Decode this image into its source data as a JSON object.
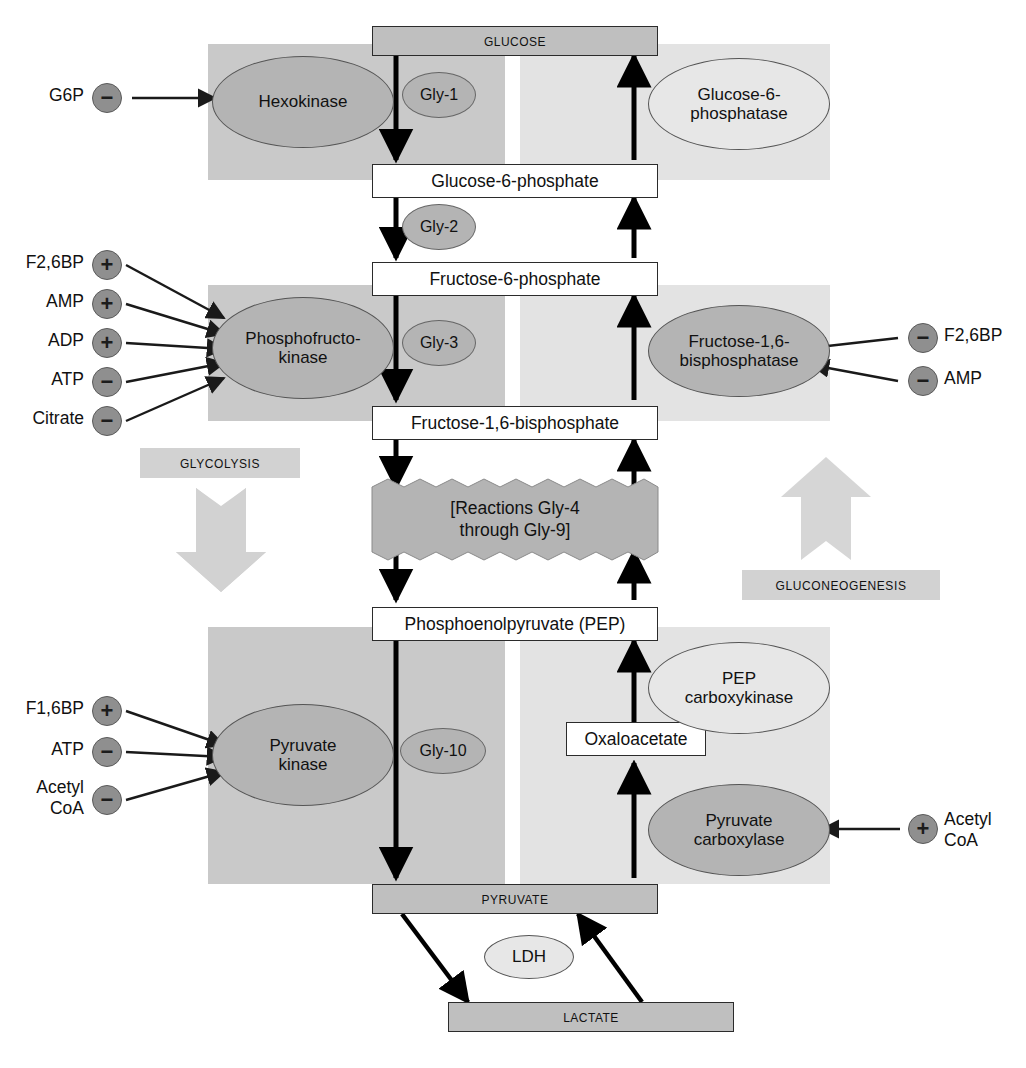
{
  "diagram": {
    "pathway_labels": {
      "glycolysis": "GLYCOLYSIS",
      "gluconeogenesis": "GLUCONEOGENESIS"
    },
    "colors": {
      "glycolysis_band": "#c9c9c9",
      "gluconeogenesis_band": "#e3e3e3",
      "enzyme_dark": "#b4b4b4",
      "enzyme_light": "#e7e7e7",
      "terminal_box": "#bfbfbf",
      "regulator_circle": "#8f8f8f",
      "pathway_label_bg": "#d2d2d2",
      "arrow": "#000000"
    }
  },
  "metabolites": [
    {
      "id": "glucose",
      "label": "GLUCOSE",
      "style": "terminal"
    },
    {
      "id": "g6p",
      "label": "Glucose-6-phosphate",
      "style": "box"
    },
    {
      "id": "f6p",
      "label": "Fructose-6-phosphate",
      "style": "box"
    },
    {
      "id": "f16bp",
      "label": "Fructose-1,6-bisphosphate",
      "style": "box"
    },
    {
      "id": "pep",
      "label": "Phosphoenolpyruvate (PEP)",
      "style": "box"
    },
    {
      "id": "oaa",
      "label": "Oxaloacetate",
      "style": "box"
    },
    {
      "id": "pyruvate",
      "label": "PYRUVATE",
      "style": "terminal"
    },
    {
      "id": "lactate",
      "label": "LACTATE",
      "style": "terminal"
    }
  ],
  "reaction_block": {
    "line1": "[Reactions Gly-4",
    "line2": "through Gly-9]"
  },
  "steps": [
    {
      "id": "gly1",
      "label": "Gly-1"
    },
    {
      "id": "gly2",
      "label": "Gly-2"
    },
    {
      "id": "gly3",
      "label": "Gly-3"
    },
    {
      "id": "gly10",
      "label": "Gly-10"
    }
  ],
  "enzymes": {
    "glycolytic": [
      {
        "id": "hexokinase",
        "line1": "Hexokinase",
        "line2": "",
        "fill": "dark"
      },
      {
        "id": "pfk",
        "line1": "Phosphofructo-",
        "line2": "kinase",
        "fill": "dark"
      },
      {
        "id": "pyruvate-kinase",
        "line1": "Pyruvate",
        "line2": "kinase",
        "fill": "dark"
      }
    ],
    "gluconeogenic": [
      {
        "id": "g6pase",
        "line1": "Glucose-6-",
        "line2": "phosphatase",
        "fill": "light"
      },
      {
        "id": "fbpase",
        "line1": "Fructose-1,6-",
        "line2": "bisphosphatase",
        "fill": "dark"
      },
      {
        "id": "pepck",
        "line1": "PEP",
        "line2": "carboxykinase",
        "fill": "light"
      },
      {
        "id": "pyruvate-carboxylase",
        "line1": "Pyruvate",
        "line2": "carboxylase",
        "fill": "dark"
      }
    ],
    "shared": [
      {
        "id": "ldh",
        "line1": "LDH",
        "line2": "",
        "fill": "light"
      }
    ]
  },
  "regulators": {
    "hexokinase": [
      {
        "label": "G6P",
        "sign": "−",
        "effect": "inhibits"
      }
    ],
    "phosphofructokinase": [
      {
        "label": "F2,6BP",
        "sign": "+",
        "effect": "activates"
      },
      {
        "label": "AMP",
        "sign": "+",
        "effect": "activates"
      },
      {
        "label": "ADP",
        "sign": "+",
        "effect": "activates"
      },
      {
        "label": "ATP",
        "sign": "−",
        "effect": "inhibits"
      },
      {
        "label": "Citrate",
        "sign": "−",
        "effect": "inhibits"
      }
    ],
    "fructose_1_6_bisphosphatase": [
      {
        "label": "F2,6BP",
        "sign": "−",
        "effect": "inhibits"
      },
      {
        "label": "AMP",
        "sign": "−",
        "effect": "inhibits"
      }
    ],
    "pyruvate_kinase": [
      {
        "label": "F1,6BP",
        "sign": "+",
        "effect": "activates"
      },
      {
        "label": "ATP",
        "sign": "−",
        "effect": "inhibits"
      },
      {
        "label": "Acetyl\nCoA",
        "line1": "Acetyl",
        "line2": "CoA",
        "sign": "−",
        "effect": "inhibits"
      }
    ],
    "pyruvate_carboxylase": [
      {
        "label": "Acetyl CoA",
        "line1": "Acetyl",
        "line2": "CoA",
        "sign": "+",
        "effect": "activates"
      }
    ]
  }
}
